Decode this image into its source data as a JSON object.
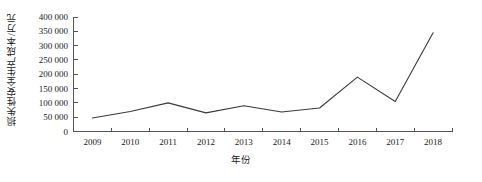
{
  "chart_data": {
    "type": "line",
    "title": "",
    "xlabel": "年份",
    "ylabel": "损失性安全生产成本/万元",
    "categories": [
      "2009",
      "2010",
      "2011",
      "2012",
      "2013",
      "2014",
      "2015",
      "2016",
      "2017",
      "2018"
    ],
    "values": [
      47000,
      70000,
      100000,
      65000,
      90000,
      68000,
      82000,
      190000,
      105000,
      345000
    ],
    "series": [
      {
        "name": "损失性安全生产成本",
        "values": [
          47000,
          70000,
          100000,
          65000,
          90000,
          68000,
          82000,
          190000,
          105000,
          345000
        ]
      }
    ],
    "ylim": [
      0,
      400000
    ],
    "ytick_values": [
      0,
      50000,
      100000,
      150000,
      200000,
      250000,
      300000,
      350000,
      400000
    ],
    "ytick_labels": [
      "0",
      "50 000",
      "100 000",
      "150 000",
      "200 000",
      "250 000",
      "300 000",
      "350 000",
      "400 000"
    ],
    "xtick_labels": [
      "2009",
      "2010",
      "2011",
      "2012",
      "2013",
      "2014",
      "2015",
      "2016",
      "2017",
      "2018"
    ],
    "grid": false,
    "legend": false,
    "legend_position": "none",
    "line_color": "#3a3a3a",
    "axis_color": "#555555",
    "background_color": "#ffffff",
    "markers": false
  }
}
